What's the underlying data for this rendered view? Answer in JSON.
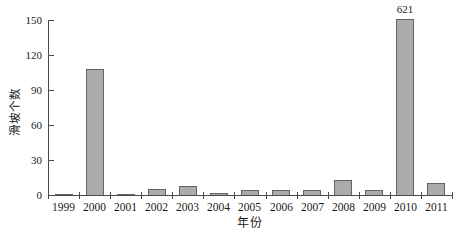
{
  "chart_data": {
    "type": "bar",
    "title": "",
    "xlabel": "年份",
    "ylabel": "滑坡个数",
    "categories": [
      "1999",
      "2000",
      "2001",
      "2002",
      "2003",
      "2004",
      "2005",
      "2006",
      "2007",
      "2008",
      "2009",
      "2010",
      "2011"
    ],
    "values": [
      1,
      108,
      1,
      5,
      8,
      2,
      4,
      4,
      4,
      13,
      4,
      621,
      10
    ],
    "ylim": [
      0,
      150
    ],
    "yticks": [
      0,
      30,
      60,
      90,
      120,
      150
    ],
    "clip_display_max": 151,
    "annotations": [
      {
        "category": "2010",
        "text": "621"
      }
    ],
    "legend": null,
    "grid": false,
    "colors": {
      "bar_fill": "#ababab",
      "bar_border": "#636363",
      "axis": "#4a4a4a",
      "text": "#1a1a1a",
      "background": "#ffffff"
    }
  }
}
